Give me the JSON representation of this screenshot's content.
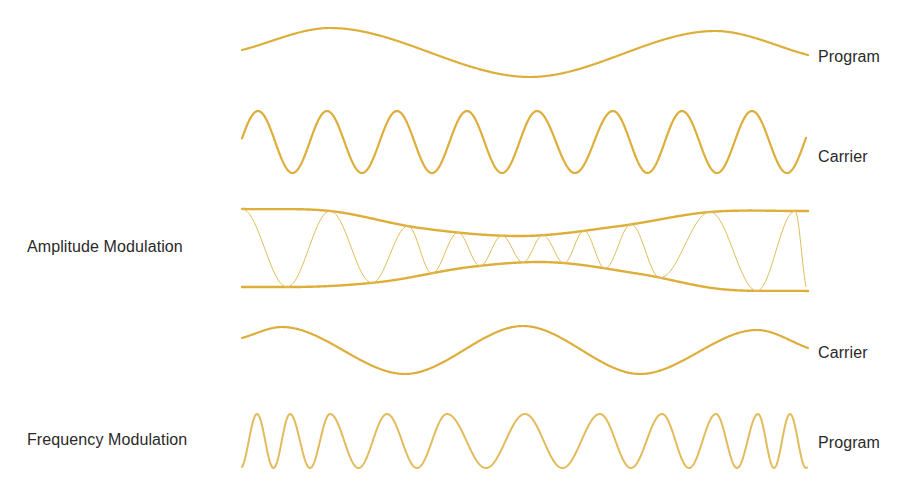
{
  "figure": {
    "colors": {
      "wave": "#DDAE3A",
      "wave_thin": "#E2BC5C",
      "label": "#2a2a2a",
      "background": "#ffffff"
    },
    "rows": [
      {
        "id": "program",
        "right_label": "Program",
        "left_label": ""
      },
      {
        "id": "carrier",
        "right_label": "Carrier",
        "left_label": ""
      },
      {
        "id": "am",
        "right_label": "",
        "left_label": "Amplitude Modulation"
      },
      {
        "id": "fm-carrier",
        "right_label": "Carrier",
        "left_label": ""
      },
      {
        "id": "fm",
        "right_label": "Program",
        "left_label": "Frequency Modulation"
      }
    ],
    "waves": {
      "program": {
        "x0": 242,
        "x1": 808,
        "type": "points",
        "points": [
          [
            242,
            50
          ],
          [
            330,
            28
          ],
          [
            530,
            77
          ],
          [
            715,
            31
          ],
          [
            808,
            55
          ]
        ]
      },
      "carrier": {
        "x0": 242,
        "x1": 806,
        "center": 142,
        "amp": 31,
        "peaks": [
          258,
          327,
          397,
          467,
          537,
          613,
          682,
          752
        ]
      },
      "am": {
        "x0": 242,
        "x1": 808,
        "upper": [
          [
            242,
            209
          ],
          [
            330,
            211
          ],
          [
            420,
            228
          ],
          [
            520,
            236
          ],
          [
            620,
            226
          ],
          [
            710,
            212
          ],
          [
            808,
            211
          ]
        ],
        "lower": [
          [
            242,
            287
          ],
          [
            290,
            287
          ],
          [
            380,
            282
          ],
          [
            470,
            267
          ],
          [
            540,
            262
          ],
          [
            640,
            274
          ],
          [
            720,
            289
          ],
          [
            808,
            291
          ]
        ],
        "peaks": [
          330,
          408,
          458,
          502,
          543,
          584,
          631,
          710,
          795
        ],
        "troughs": [
          287,
          372,
          432,
          480,
          523,
          564,
          605,
          660,
          757
        ]
      },
      "fm_carrier": {
        "x0": 242,
        "x1": 808,
        "type": "points",
        "points": [
          [
            242,
            338
          ],
          [
            282,
            327
          ],
          [
            405,
            374
          ],
          [
            523,
            326
          ],
          [
            640,
            374
          ],
          [
            757,
            330
          ],
          [
            808,
            348
          ]
        ]
      },
      "fm": {
        "x0": 242,
        "x1": 807,
        "center": 441,
        "amp": 27,
        "peaks": [
          257,
          290,
          330,
          387,
          447,
          525,
          600,
          662,
          716,
          758,
          790
        ]
      }
    }
  }
}
